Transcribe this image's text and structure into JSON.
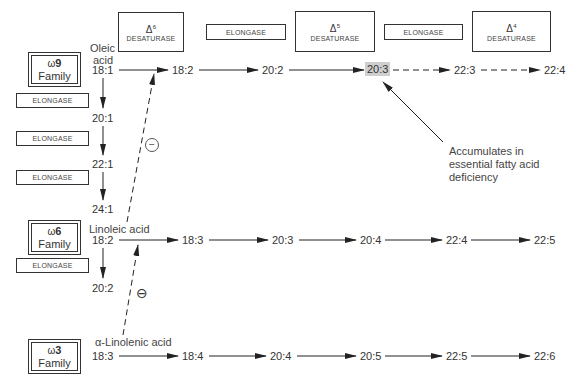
{
  "enzymes": {
    "d6": {
      "delta": "Δ",
      "sup": "6",
      "name": "DESATURASE"
    },
    "elong_top1": {
      "name": "ELONGASE"
    },
    "d5": {
      "delta": "Δ",
      "sup": "5",
      "name": "DESATURASE"
    },
    "elong_top2": {
      "name": "ELONGASE"
    },
    "d4": {
      "delta": "Δ",
      "sup": "4",
      "name": "DESATURASE"
    },
    "elong_w9_1": {
      "name": "ELONGASE"
    },
    "elong_w9_2": {
      "name": "ELONGASE"
    },
    "elong_w9_3": {
      "name": "ELONGASE"
    },
    "elong_w6": {
      "name": "ELONGASE"
    }
  },
  "families": {
    "w9": {
      "omega": "ω",
      "num": "9",
      "word": "Family"
    },
    "w6": {
      "omega": "ω",
      "num": "6",
      "word": "Family"
    },
    "w3": {
      "omega": "ω",
      "num": "3",
      "word": "Family"
    }
  },
  "rows": {
    "w9": {
      "acid_name_line1": "Oleic",
      "acid_name_line2": "acid",
      "nodes": [
        "18:1",
        "18:2",
        "20:2",
        "20:3",
        "22:3",
        "22:4"
      ],
      "elongation_chain": [
        "20:1",
        "22:1",
        "24:1"
      ]
    },
    "w6": {
      "acid_name": "Linoleic acid",
      "nodes": [
        "18:2",
        "18:3",
        "20:3",
        "20:4",
        "22:4",
        "22:5"
      ],
      "elongation_chain": [
        "20:2"
      ]
    },
    "w3": {
      "acid_name": "α-Linolenic acid",
      "nodes": [
        "18:3",
        "18:4",
        "20:4",
        "20:5",
        "22:5",
        "22:6"
      ]
    }
  },
  "inhibition": {
    "symbol_upper": "−",
    "symbol_lower": "⊖"
  },
  "annotation": {
    "line1": "Accumulates in",
    "line2": "essential fatty acid",
    "line3": "deficiency"
  },
  "colors": {
    "line": "#222222",
    "highlight": "#cfcfcf",
    "text": "#333333"
  }
}
